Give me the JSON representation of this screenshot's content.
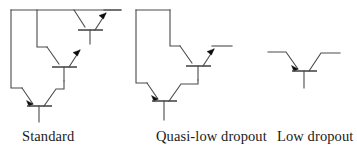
{
  "figure": {
    "background_color": "#ffffff",
    "line_color": "#4a4a4a",
    "arrow_color": "#0d0d0d",
    "width": 357,
    "height": 155
  },
  "diagrams": [
    {
      "id": "standard",
      "caption": "Standard",
      "transistor_count": 3,
      "description": "Darlington NPN pass element with three stacked bipolar transistors"
    },
    {
      "id": "quasi-low-dropout",
      "caption": "Quasi-low dropout",
      "transistor_count": 2,
      "description": "Two bipolar transistors forming a quasi-low dropout pass element"
    },
    {
      "id": "low-dropout",
      "caption": "Low dropout",
      "transistor_count": 1,
      "description": "Single PNP transistor low dropout pass element"
    }
  ],
  "captions": {
    "standard": "Standard",
    "quasi_low_dropout": "Quasi-low dropout",
    "low_dropout": "Low dropout"
  }
}
